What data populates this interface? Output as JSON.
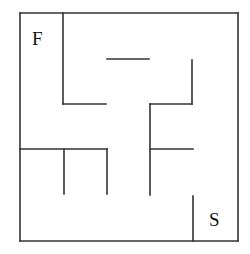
{
  "diagram": {
    "type": "maze",
    "stroke_color": "#333333",
    "background": "#ffffff",
    "labels": {
      "finish": "F",
      "start": "S"
    },
    "walls": [
      {
        "id": "outer-top",
        "x1": 20,
        "y1": 13,
        "x2": 238,
        "y2": 13
      },
      {
        "id": "outer-right",
        "x1": 238,
        "y1": 13,
        "x2": 238,
        "y2": 241
      },
      {
        "id": "outer-bottom",
        "x1": 20,
        "y1": 241,
        "x2": 238,
        "y2": 241
      },
      {
        "id": "outer-left",
        "x1": 20,
        "y1": 13,
        "x2": 20,
        "y2": 241
      },
      {
        "id": "f-cell-vertical",
        "x1": 63,
        "y1": 13,
        "x2": 63,
        "y2": 104
      },
      {
        "id": "f-cell-bottom",
        "x1": 63,
        "y1": 104,
        "x2": 106,
        "y2": 104
      },
      {
        "id": "short-horizontal-top",
        "x1": 107,
        "y1": 59,
        "x2": 149,
        "y2": 59
      },
      {
        "id": "right-upper-vertical",
        "x1": 192,
        "y1": 60,
        "x2": 192,
        "y2": 104
      },
      {
        "id": "right-upper-horizontal",
        "x1": 150,
        "y1": 104,
        "x2": 192,
        "y2": 104
      },
      {
        "id": "center-vertical",
        "x1": 150,
        "y1": 104,
        "x2": 150,
        "y2": 195
      },
      {
        "id": "center-right-branch",
        "x1": 150,
        "y1": 149,
        "x2": 193,
        "y2": 149
      },
      {
        "id": "left-mid-horizontal",
        "x1": 20,
        "y1": 149,
        "x2": 107,
        "y2": 149
      },
      {
        "id": "left-mid-stub-1",
        "x1": 64,
        "y1": 149,
        "x2": 64,
        "y2": 194
      },
      {
        "id": "left-mid-stub-2",
        "x1": 107,
        "y1": 149,
        "x2": 107,
        "y2": 194
      },
      {
        "id": "s-cell-vertical",
        "x1": 193,
        "y1": 196,
        "x2": 193,
        "y2": 241
      }
    ]
  }
}
